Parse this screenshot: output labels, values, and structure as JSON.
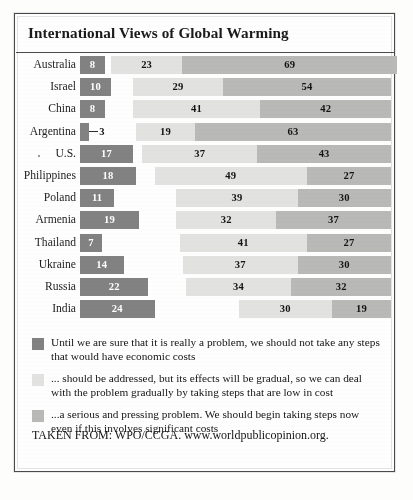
{
  "figure": {
    "title": "International Views of Global Warming",
    "source": "TAKEN FROM: WPO/CCGA. www.worldpublicopinion.org."
  },
  "legend": {
    "items": [
      {
        "color": "#828282",
        "swatch_name": "legend-swatch-not-take-steps",
        "text": "Until we are sure that it is really a problem, we should not take any steps that would have economic costs"
      },
      {
        "color": "#e2e2e0",
        "swatch_name": "legend-swatch-gradual",
        "text": "... should be addressed, but its effects will be gradual, so we can deal with the problem gradually by taking steps that are low in cost"
      },
      {
        "color": "#b9b9b7",
        "swatch_name": "legend-swatch-serious-pressing",
        "text": "...a serious and pressing problem. We should begin taking steps now even if this involves significant costs"
      }
    ]
  },
  "chart_data": {
    "type": "bar",
    "subtype": "stacked-horizontal",
    "title": "International Views of Global Warming",
    "xlabel": "",
    "ylabel": "",
    "xlim": [
      0,
      100
    ],
    "grid": false,
    "legend_position": "below",
    "categories": [
      "Australia",
      "Israel",
      "China",
      "Argentina",
      "U.S.",
      "Philippines",
      "Poland",
      "Armenia",
      "Thailand",
      "Ukraine",
      "Russia",
      "India"
    ],
    "series": [
      {
        "name": "Until we are sure that it is really a problem, we should not take any steps that would have economic costs",
        "short_name": "not take steps",
        "color": "#828282",
        "values": [
          8,
          10,
          8,
          3,
          17,
          18,
          11,
          19,
          7,
          14,
          22,
          24
        ]
      },
      {
        "name": "... should be addressed, but its effects will be gradual, so we can deal with the problem gradually by taking steps that are low in cost",
        "short_name": "gradual / low cost",
        "color": "#e2e2e0",
        "values": [
          23,
          29,
          41,
          19,
          37,
          49,
          39,
          32,
          41,
          37,
          34,
          30
        ]
      },
      {
        "name": "...a serious and pressing problem. We should begin taking steps now even if this involves significant costs",
        "short_name": "serious and pressing",
        "color": "#b9b9b7",
        "values": [
          69,
          54,
          42,
          63,
          43,
          27,
          30,
          37,
          27,
          30,
          32,
          19
        ]
      }
    ]
  }
}
